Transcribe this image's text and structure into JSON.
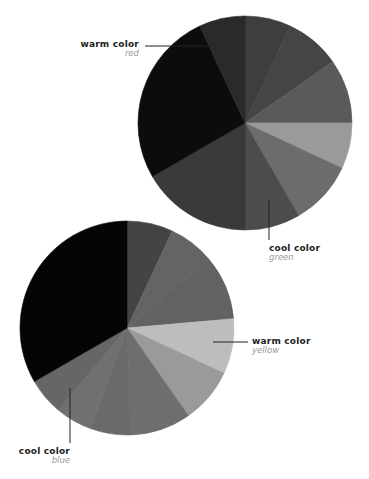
{
  "chart_data": [
    {
      "type": "pie",
      "name": "top-pie",
      "center": [
        245,
        123
      ],
      "radius": 107,
      "slices": [
        {
          "start": 0,
          "end": 25,
          "color": "#3e3e3e"
        },
        {
          "start": 25,
          "end": 55,
          "color": "#454545"
        },
        {
          "start": 55,
          "end": 90,
          "color": "#5a5a5a"
        },
        {
          "start": 90,
          "end": 115,
          "color": "#9a9a9a"
        },
        {
          "start": 115,
          "end": 150,
          "color": "#6c6c6c"
        },
        {
          "start": 150,
          "end": 180,
          "color": "#4c4c4c"
        },
        {
          "start": 180,
          "end": 240,
          "color": "#3a3a3a"
        },
        {
          "start": 240,
          "end": 335,
          "color": "#0c0c0c"
        },
        {
          "start": 335,
          "end": 360,
          "color": "#2a2a2a"
        }
      ]
    },
    {
      "type": "pie",
      "name": "bottom-pie",
      "center": [
        127,
        328
      ],
      "radius": 107,
      "slices": [
        {
          "start": 0,
          "end": 25,
          "color": "#444444"
        },
        {
          "start": 25,
          "end": 50,
          "color": "#646464"
        },
        {
          "start": 50,
          "end": 85,
          "color": "#626262"
        },
        {
          "start": 85,
          "end": 115,
          "color": "#bdbdbd"
        },
        {
          "start": 115,
          "end": 145,
          "color": "#9a9a9a"
        },
        {
          "start": 145,
          "end": 178,
          "color": "#6e6e6e"
        },
        {
          "start": 178,
          "end": 200,
          "color": "#6a6a6a"
        },
        {
          "start": 200,
          "end": 220,
          "color": "#707070"
        },
        {
          "start": 220,
          "end": 240,
          "color": "#666666"
        },
        {
          "start": 240,
          "end": 360,
          "color": "#050505"
        }
      ]
    }
  ],
  "labels": [
    {
      "title": "warm color",
      "sub": "red"
    },
    {
      "title": "cool color",
      "sub": "green"
    },
    {
      "title": "warm color",
      "sub": "yellow"
    },
    {
      "title": "cool color",
      "sub": "blue"
    }
  ]
}
